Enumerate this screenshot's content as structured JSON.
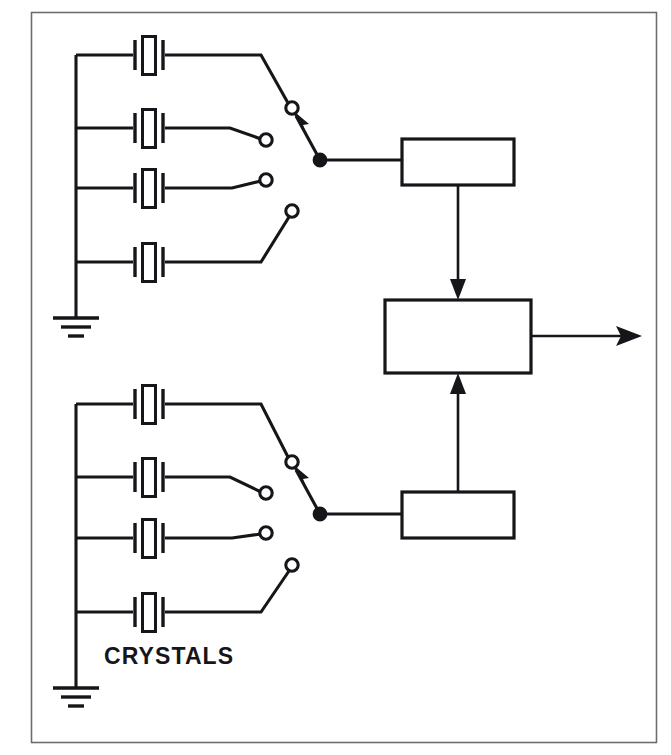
{
  "figure": {
    "kind": "schematic-block-diagram",
    "background_color": "#ffffff",
    "line_color": "#16161a",
    "frame_color": "#6e6e72"
  },
  "labels": [
    {
      "id": "crystals",
      "text": "CRYSTALS",
      "x": 104,
      "y": 664
    }
  ],
  "frame": {
    "x": 31,
    "y": 12,
    "width": 625,
    "height": 730
  },
  "banks": [
    {
      "id": "upper-bank",
      "name": "upper crystal bank",
      "bus_x": 76,
      "bus_top": 55,
      "bus_bottom": 300,
      "ground_y": 318,
      "crystals": [
        {
          "id": "upper-xtal-1",
          "row_y": 55,
          "center_x": 150,
          "selected": true
        },
        {
          "id": "upper-xtal-2",
          "row_y": 128,
          "center_x": 150,
          "selected": false
        },
        {
          "id": "upper-xtal-3",
          "row_y": 188,
          "center_x": 150,
          "selected": false
        },
        {
          "id": "upper-xtal-4",
          "row_y": 262,
          "center_x": 150,
          "selected": false
        }
      ],
      "contacts": [
        {
          "id": "upper-contact-1",
          "cx": 292,
          "cy": 108,
          "selected": true
        },
        {
          "id": "upper-contact-2",
          "cx": 266,
          "cy": 140,
          "selected": false
        },
        {
          "id": "upper-contact-3",
          "cx": 266,
          "cy": 180,
          "selected": false
        },
        {
          "id": "upper-contact-4",
          "cx": 292,
          "cy": 211,
          "selected": false
        }
      ],
      "pivot": {
        "id": "upper-switch-pivot",
        "cx": 320,
        "cy": 160
      },
      "block": {
        "id": "upper-block",
        "x": 402,
        "y": 139,
        "width": 112,
        "height": 46,
        "text": ""
      }
    },
    {
      "id": "lower-bank",
      "name": "lower crystal bank",
      "bus_x": 76,
      "bus_top": 404,
      "bus_bottom": 645,
      "ground_y": 688,
      "crystals": [
        {
          "id": "lower-xtal-1",
          "row_y": 404,
          "center_x": 150,
          "selected": true
        },
        {
          "id": "lower-xtal-2",
          "row_y": 477,
          "center_x": 150,
          "selected": false
        },
        {
          "id": "lower-xtal-3",
          "row_y": 538,
          "center_x": 150,
          "selected": false
        },
        {
          "id": "lower-xtal-4",
          "row_y": 612,
          "center_x": 150,
          "selected": false
        }
      ],
      "contacts": [
        {
          "id": "lower-contact-1",
          "cx": 292,
          "cy": 462,
          "selected": true
        },
        {
          "id": "lower-contact-2",
          "cx": 266,
          "cy": 493,
          "selected": false
        },
        {
          "id": "lower-contact-3",
          "cx": 266,
          "cy": 533,
          "selected": false
        },
        {
          "id": "lower-contact-4",
          "cx": 292,
          "cy": 565,
          "selected": false
        }
      ],
      "pivot": {
        "id": "lower-switch-pivot",
        "cx": 320,
        "cy": 514
      },
      "block": {
        "id": "lower-block",
        "x": 402,
        "y": 492,
        "width": 112,
        "height": 46,
        "text": ""
      }
    }
  ],
  "mixer": {
    "id": "mixer-block",
    "x": 385,
    "y": 300,
    "width": 146,
    "height": 73,
    "text": ""
  },
  "connections": [
    {
      "id": "upper-block-to-mixer",
      "from": "upper-block",
      "to": "mixer-block",
      "direction": "down",
      "arrow": true
    },
    {
      "id": "lower-block-to-mixer",
      "from": "lower-block",
      "to": "mixer-block",
      "direction": "up",
      "arrow": true
    },
    {
      "id": "mixer-output",
      "from": "mixer-block",
      "to": "output",
      "direction": "right",
      "arrow": true
    }
  ],
  "output": {
    "id": "output-arrow",
    "x_start": 531,
    "x_end": 640,
    "y": 336
  },
  "geometry": {
    "crystal_plate_gap": 18,
    "crystal_plate_height": 30,
    "crystal_body_width": 13,
    "crystal_body_height": 38,
    "contact_radius": 6.5,
    "pivot_radius": 6.5,
    "ground_bar_widths": [
      46,
      30,
      16
    ],
    "ground_bar_spacing": 9
  }
}
